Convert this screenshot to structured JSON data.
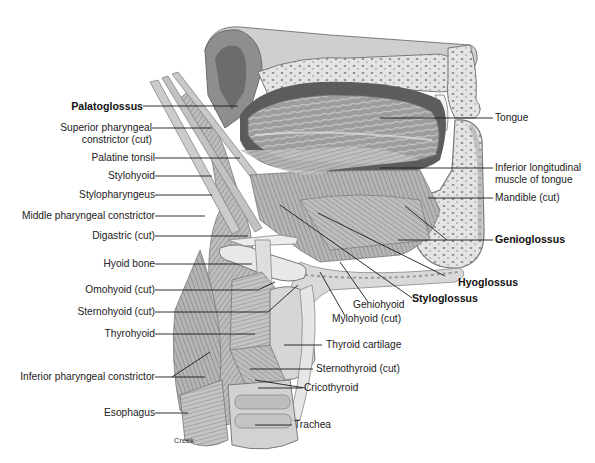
{
  "figure": {
    "artist_signature": "Creek"
  },
  "labels_left": [
    {
      "id": "palatoglossus",
      "text": "Palatoglossus",
      "bold": true
    },
    {
      "id": "superior-pharyngeal-constrictor",
      "text": "Superior pharyngeal\nconstrictor (cut)",
      "bold": false
    },
    {
      "id": "palatine-tonsil",
      "text": "Palatine tonsil",
      "bold": false
    },
    {
      "id": "stylohyoid",
      "text": "Stylohyoid",
      "bold": false
    },
    {
      "id": "stylopharyngeus",
      "text": "Stylopharyngeus",
      "bold": false
    },
    {
      "id": "middle-pharyngeal-constrictor",
      "text": "Middle pharyngeal constrictor",
      "bold": false
    },
    {
      "id": "digastric",
      "text": "Digastric (cut)",
      "bold": false
    },
    {
      "id": "hyoid-bone",
      "text": "Hyoid bone",
      "bold": false
    },
    {
      "id": "omohyoid",
      "text": "Omohyoid (cut)",
      "bold": false
    },
    {
      "id": "sternohyoid",
      "text": "Sternohyoid (cut)",
      "bold": false
    },
    {
      "id": "thyrohyoid",
      "text": "Thyrohyoid",
      "bold": false
    },
    {
      "id": "inferior-pharyngeal-constrictor",
      "text": "Inferior pharyngeal constrictor",
      "bold": false
    },
    {
      "id": "esophagus",
      "text": "Esophagus",
      "bold": false
    }
  ],
  "labels_right": [
    {
      "id": "tongue",
      "text": "Tongue",
      "bold": false
    },
    {
      "id": "inferior-longitudinal-muscle",
      "text": "Inferior longitudinal\nmuscle of tongue",
      "bold": false
    },
    {
      "id": "mandible",
      "text": "Mandible (cut)",
      "bold": false
    },
    {
      "id": "genioglossus",
      "text": "Genioglossus",
      "bold": true
    },
    {
      "id": "hyoglossus",
      "text": "Hyoglossus",
      "bold": true
    },
    {
      "id": "styloglossus",
      "text": "Styloglossus",
      "bold": true
    },
    {
      "id": "geniohyoid",
      "text": "Geniohyoid",
      "bold": false
    },
    {
      "id": "mylohyoid",
      "text": "Mylohyoid (cut)",
      "bold": false
    },
    {
      "id": "thyroid-cartilage",
      "text": "Thyroid cartilage",
      "bold": false
    },
    {
      "id": "sternothyroid",
      "text": "Sternothyroid (cut)",
      "bold": false
    },
    {
      "id": "cricothyroid",
      "text": "Cricothyroid",
      "bold": false
    },
    {
      "id": "trachea",
      "text": "Trachea",
      "bold": false
    }
  ],
  "colors": {
    "background": "#ffffff",
    "label_text": "#222222",
    "leader_line": "#1a1a1a",
    "muscle_light": "#cfcfcf",
    "muscle_mid": "#a9a9a9",
    "muscle_dark": "#6e6e6e",
    "bone": "#e6e6e6",
    "cavity_dark": "#5a5a5a"
  }
}
